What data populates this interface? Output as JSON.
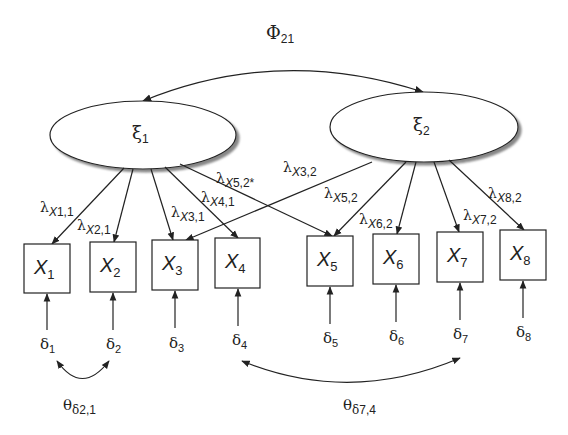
{
  "diagram": {
    "type": "structural-equation-model-path-diagram",
    "covariance_latent": {
      "symbol": "Φ",
      "subscript": "21"
    },
    "latent_factors": [
      {
        "id": "xi1",
        "symbol": "ξ",
        "subscript": "1"
      },
      {
        "id": "xi2",
        "symbol": "ξ",
        "subscript": "2"
      }
    ],
    "indicators": [
      {
        "id": "X1",
        "symbol": "X",
        "subscript": "1"
      },
      {
        "id": "X2",
        "symbol": "X",
        "subscript": "2"
      },
      {
        "id": "X3",
        "symbol": "X",
        "subscript": "3"
      },
      {
        "id": "X4",
        "symbol": "X",
        "subscript": "4"
      },
      {
        "id": "X5",
        "symbol": "X",
        "subscript": "5"
      },
      {
        "id": "X6",
        "symbol": "X",
        "subscript": "6"
      },
      {
        "id": "X7",
        "symbol": "X",
        "subscript": "7"
      },
      {
        "id": "X8",
        "symbol": "X",
        "subscript": "8"
      }
    ],
    "errors": [
      {
        "symbol": "δ",
        "subscript": "1"
      },
      {
        "symbol": "δ",
        "subscript": "2"
      },
      {
        "symbol": "δ",
        "subscript": "3"
      },
      {
        "symbol": "δ",
        "subscript": "4"
      },
      {
        "symbol": "δ",
        "subscript": "5"
      },
      {
        "symbol": "δ",
        "subscript": "6"
      },
      {
        "symbol": "δ",
        "subscript": "7"
      },
      {
        "symbol": "δ",
        "subscript": "8"
      }
    ],
    "loadings": [
      {
        "symbol": "λ",
        "x": "X",
        "idx": "1,1",
        "from": "xi1",
        "to": "X1"
      },
      {
        "symbol": "λ",
        "x": "X",
        "idx": "2,1",
        "from": "xi1",
        "to": "X2"
      },
      {
        "symbol": "λ",
        "x": "X",
        "idx": "3,1",
        "from": "xi1",
        "to": "X3"
      },
      {
        "symbol": "λ",
        "x": "X",
        "idx": "4,1",
        "from": "xi1",
        "to": "X4"
      },
      {
        "symbol": "λ",
        "x": "X",
        "idx": "5,2*",
        "from": "xi1",
        "to": "X5"
      },
      {
        "symbol": "λ",
        "x": "X",
        "idx": "3,2",
        "from": "xi2",
        "to": "X3"
      },
      {
        "symbol": "λ",
        "x": "X",
        "idx": "5,2",
        "from": "xi2",
        "to": "X5"
      },
      {
        "symbol": "λ",
        "x": "X",
        "idx": "6,2",
        "from": "xi2",
        "to": "X6"
      },
      {
        "symbol": "λ",
        "x": "X",
        "idx": "7,2",
        "from": "xi2",
        "to": "X7"
      },
      {
        "symbol": "λ",
        "x": "X",
        "idx": "8,2",
        "from": "xi2",
        "to": "X8"
      }
    ],
    "error_covariances": [
      {
        "symbol": "θ",
        "sub_symbol": "δ",
        "idx": "2,1",
        "between": [
          "δ1",
          "δ2"
        ]
      },
      {
        "symbol": "θ",
        "sub_symbol": "δ",
        "idx": "7,4",
        "between": [
          "δ4",
          "δ7"
        ]
      }
    ]
  }
}
